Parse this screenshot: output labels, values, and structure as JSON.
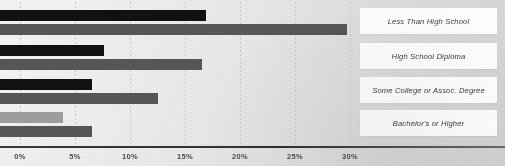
{
  "chart_data": {
    "type": "bar",
    "orientation": "horizontal",
    "title": "",
    "xlabel": "",
    "ylabel": "",
    "xlim": [
      0,
      32
    ],
    "grid": true,
    "legend_position": "none",
    "xticks": [
      "0%",
      "5%",
      "10%",
      "15%",
      "20%",
      "25%",
      "30%"
    ],
    "xtick_values": [
      0,
      5,
      10,
      15,
      20,
      25,
      30
    ],
    "categories": [
      "Less Than High School",
      "High School Diploma",
      "Some College or Assoc. Degree",
      "Bachelor's or Higher"
    ],
    "series": [
      {
        "name": "series-1",
        "color": "#111111",
        "values": [
          16.9,
          7.6,
          6.5,
          3.9
        ]
      },
      {
        "name": "series-2",
        "color": "#565656",
        "values": [
          29.7,
          16.5,
          12.5,
          6.5
        ]
      }
    ],
    "bar_colors": [
      [
        "#111111",
        "#565656"
      ],
      [
        "#111111",
        "#565656"
      ],
      [
        "#111111",
        "#565656"
      ],
      [
        "#9d9d9d",
        "#565656"
      ]
    ]
  },
  "axis": {
    "baseline_color": "#3a3a3a"
  }
}
